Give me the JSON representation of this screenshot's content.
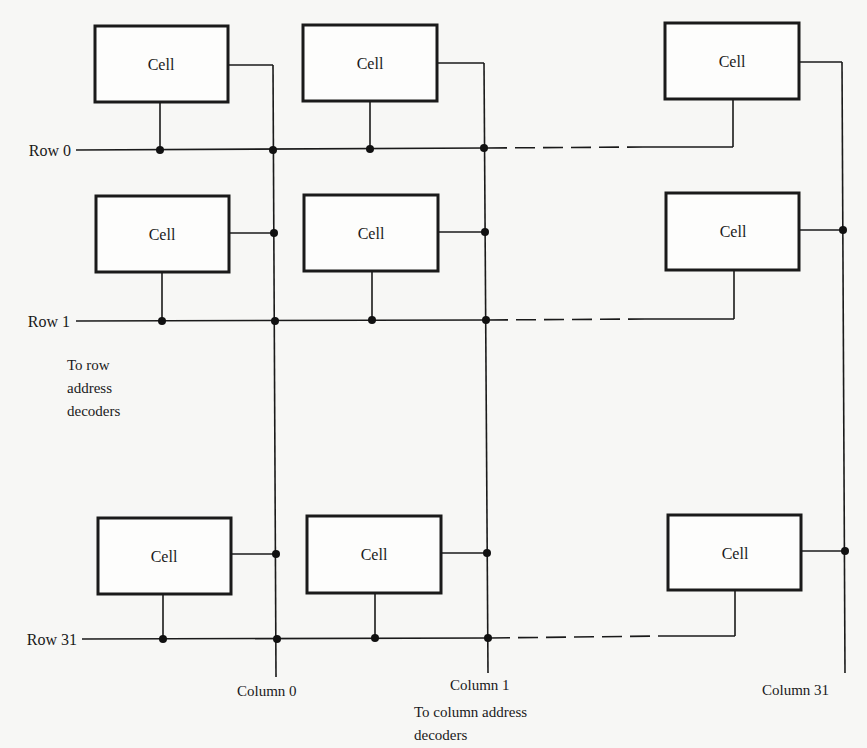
{
  "diagram": {
    "cell_label": "Cell",
    "rows": [
      {
        "label": "Row 0",
        "y": 150
      },
      {
        "label": "Row 1",
        "y": 321
      },
      {
        "label": "Row 31",
        "y": 639
      }
    ],
    "columns": [
      {
        "label": "Column 0",
        "x": 274
      },
      {
        "label": "Column 1",
        "x": 486
      },
      {
        "label": "Column 31",
        "x": 843
      }
    ],
    "row_decoder_note": [
      "To row",
      "address",
      "decoders"
    ],
    "column_decoder_note": [
      "To column address",
      "decoders"
    ]
  }
}
